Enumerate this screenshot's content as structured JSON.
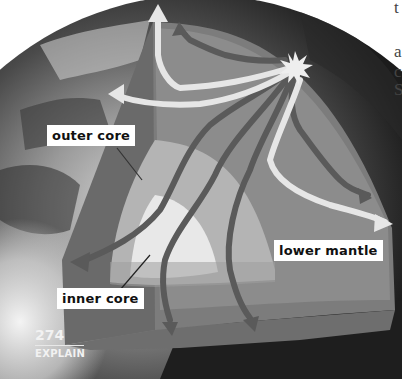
{
  "figure": {
    "labels": {
      "outer_core": "outer core",
      "inner_core": "inner core",
      "lower_mantle": "lower mantle"
    },
    "footer": {
      "page_number": "274",
      "section": "EXPLAIN"
    },
    "cropped_side_text": [
      "t",
      "a",
      "c",
      "S"
    ],
    "elements": {
      "epicenter": "starburst-icon",
      "wave_paths": "seismic-wave-arrows"
    },
    "colors": {
      "background": "#ffffff",
      "globe_dark": "#2e2e2e",
      "crust_cut": "#6a6a6a",
      "mantle": "#8c8c8c",
      "outer_core": "#b4b4b4",
      "inner_core": "#e8e8e8",
      "wave_light": "#e6e6e6",
      "wave_dark": "#5a5a5a",
      "label_bg": "#ffffff",
      "label_text": "#111111"
    }
  }
}
